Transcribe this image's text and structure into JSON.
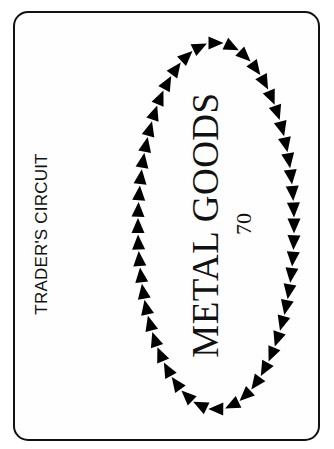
{
  "card": {
    "category_label": "TRADER'S CIRCUIT",
    "title": "METAL GOODS",
    "value": "70"
  },
  "ring": {
    "icon": "arrow-triangle-icon",
    "direction": "clockwise",
    "count": 52,
    "center_x": 216,
    "center_y": 226,
    "radius_x": 78,
    "radius_y": 183,
    "triangle_length": 15,
    "triangle_width": 13,
    "color": "#000000"
  },
  "colors": {
    "background": "#ffffff",
    "border": "#111111",
    "ink": "#111111"
  }
}
